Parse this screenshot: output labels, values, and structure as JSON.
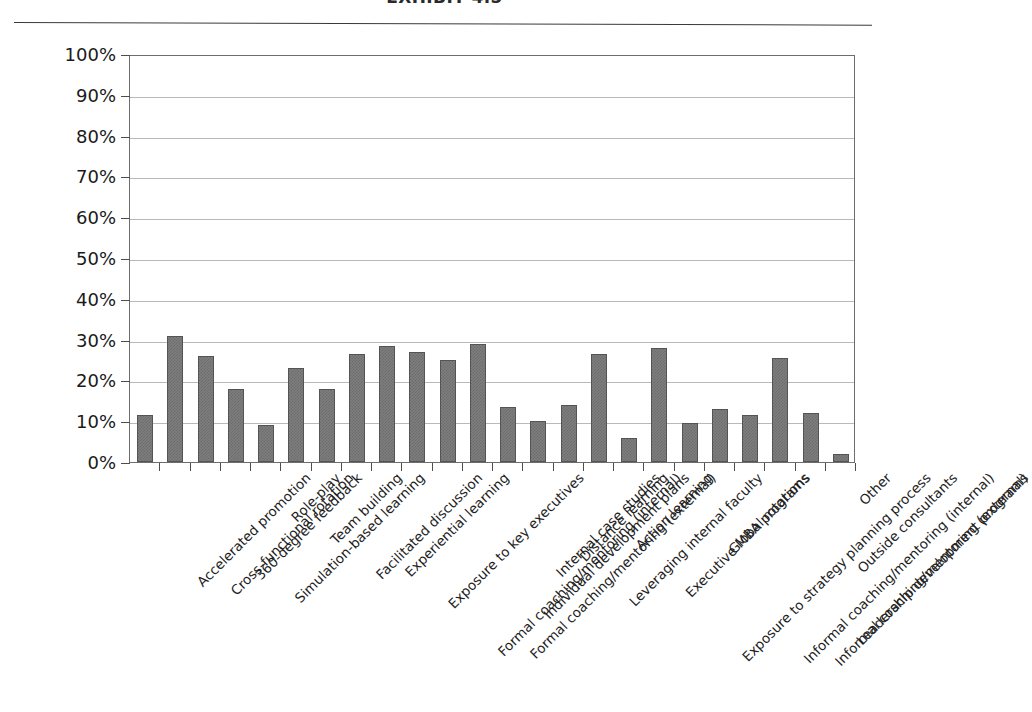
{
  "header": {
    "title": "EXHIBIT 4.5",
    "rule": "header-divider"
  },
  "chart_data": {
    "type": "bar",
    "title": "EXHIBIT 4.5",
    "xlabel": "",
    "ylabel": "",
    "ylim": [
      0,
      100
    ],
    "ytick_labels": [
      "100%",
      "90%",
      "80%",
      "70%",
      "60%",
      "50%",
      "40%",
      "30%",
      "20%",
      "10%",
      "0%"
    ],
    "ytick_values": [
      100,
      90,
      80,
      70,
      60,
      50,
      40,
      30,
      20,
      10,
      0
    ],
    "grid": true,
    "legend": "none",
    "bar_color": "#7e7e7e",
    "bar_border_color": "#545454",
    "categories": [
      "Accelerated promotion",
      "Cross-functional rotation",
      "360-degree feedback",
      "Simulation-based learning",
      "Role-play",
      "Team building",
      "Facilitated discussion",
      "Experiential learning",
      "Exposure to key executives",
      "Formal coaching/mentoring (internal)",
      "Formal coaching/mentoring (external)",
      "Individual development plans",
      "Internal case studies",
      "Distance learning",
      "Leveraging internal faculty",
      "Action learning",
      "Executive MBA programs",
      "Exposure to strategy planning process",
      "Global rotations",
      "Informal coaching/mentoring (internal)",
      "Informal coaching/mentoring (external)",
      "Leadership development programs",
      "Outside consultants",
      "Other"
    ],
    "values": [
      11.5,
      31,
      26,
      18,
      9,
      23,
      18,
      26.5,
      28.5,
      27,
      25,
      29,
      13.5,
      10,
      14,
      26.5,
      6,
      28,
      9.5,
      13,
      11.5,
      25.5,
      12,
      2
    ]
  }
}
